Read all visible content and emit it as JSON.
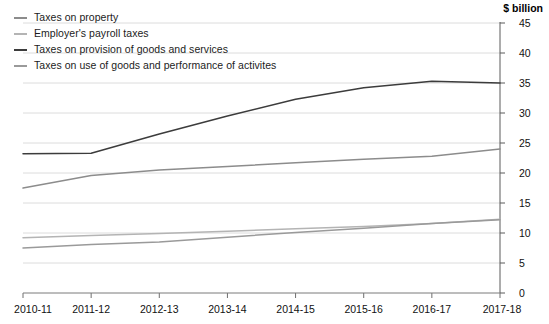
{
  "unit_title": "$ billion",
  "legend": {
    "position": "top-left",
    "items": [
      {
        "label": "Taxes on property",
        "color": "#8c8c8c"
      },
      {
        "label": "Employer's payroll taxes",
        "color": "#b4b4b4"
      },
      {
        "label": "Taxes on provision of goods and services",
        "color": "#3c3c3c"
      },
      {
        "label": "Taxes on use of goods and performance of activites",
        "color": "#9a9a9a"
      }
    ]
  },
  "chart_data": {
    "type": "line",
    "title": "",
    "subtitle": "",
    "xlabel": "",
    "ylabel": "$ billion",
    "ylim": [
      0,
      45
    ],
    "ytick_step": 5,
    "yticks": [
      0,
      5,
      10,
      15,
      20,
      25,
      30,
      35,
      40,
      45
    ],
    "grid": true,
    "grid_axis": "y",
    "legend_position": "top-left",
    "categories": [
      "2010-11",
      "2011-12",
      "2012-13",
      "2013-14",
      "2014-15",
      "2015-16",
      "2016-17",
      "2017-18"
    ],
    "series": [
      {
        "name": "Taxes on property",
        "color": "#8c8c8c",
        "values": [
          17.5,
          19.6,
          20.5,
          21.1,
          21.7,
          22.3,
          22.8,
          24.0
        ]
      },
      {
        "name": "Employer's payroll taxes",
        "color": "#b4b4b4",
        "values": [
          9.2,
          9.6,
          9.9,
          10.3,
          10.7,
          11.1,
          11.6,
          12.3
        ]
      },
      {
        "name": "Taxes on provision of goods and services",
        "color": "#3c3c3c",
        "values": [
          23.2,
          23.3,
          26.5,
          29.5,
          32.3,
          34.2,
          35.3,
          35.0
        ]
      },
      {
        "name": "Taxes on use of goods and performance of activites",
        "color": "#9a9a9a",
        "values": [
          7.5,
          8.1,
          8.5,
          9.3,
          10.1,
          10.8,
          11.6,
          12.2
        ]
      }
    ]
  }
}
